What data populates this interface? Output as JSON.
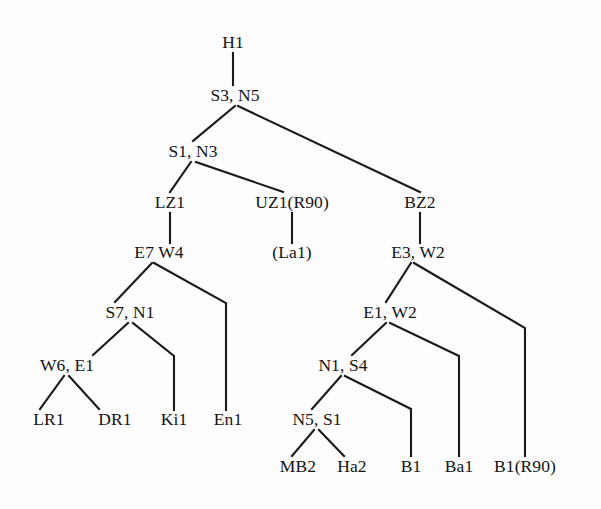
{
  "diagram": {
    "type": "tree",
    "stroke_color": "#1a1a1a",
    "text_color": "#141414",
    "background_color": "#fdfdfd",
    "nodes": [
      {
        "id": "h1",
        "label": "H1",
        "x": 233,
        "y": 43
      },
      {
        "id": "s3n5",
        "label": "S3, N5",
        "x": 235,
        "y": 96
      },
      {
        "id": "s1n3",
        "label": "S1, N3",
        "x": 193,
        "y": 152
      },
      {
        "id": "lz1",
        "label": "LZ1",
        "x": 170,
        "y": 203
      },
      {
        "id": "uz1r90",
        "label": "UZ1(R90)",
        "x": 292,
        "y": 203
      },
      {
        "id": "bz2",
        "label": "BZ2",
        "x": 420,
        "y": 203
      },
      {
        "id": "e7w4",
        "label": "E7 W4",
        "x": 159,
        "y": 253
      },
      {
        "id": "la1",
        "label": "(La1)",
        "x": 292,
        "y": 253
      },
      {
        "id": "e3w2",
        "label": "E3, W2",
        "x": 418,
        "y": 253
      },
      {
        "id": "s7n1",
        "label": "S7, N1",
        "x": 130,
        "y": 313
      },
      {
        "id": "e1w2",
        "label": "E1, W2",
        "x": 390,
        "y": 313
      },
      {
        "id": "w6e1",
        "label": "W6, E1",
        "x": 67,
        "y": 366
      },
      {
        "id": "n1s4",
        "label": "N1, S4",
        "x": 343,
        "y": 366
      },
      {
        "id": "lr1",
        "label": "LR1",
        "x": 49,
        "y": 420
      },
      {
        "id": "dr1",
        "label": "DR1",
        "x": 115,
        "y": 420
      },
      {
        "id": "ki1",
        "label": "Ki1",
        "x": 174,
        "y": 420
      },
      {
        "id": "en1",
        "label": "En1",
        "x": 228,
        "y": 420
      },
      {
        "id": "n5s1",
        "label": "N5, S1",
        "x": 317,
        "y": 420
      },
      {
        "id": "mb2",
        "label": "MB2",
        "x": 298,
        "y": 467
      },
      {
        "id": "ha2",
        "label": "Ha2",
        "x": 352,
        "y": 467
      },
      {
        "id": "b1",
        "label": "B1",
        "x": 411,
        "y": 467
      },
      {
        "id": "ba1",
        "label": "Ba1",
        "x": 459,
        "y": 467
      },
      {
        "id": "b1r90",
        "label": "B1(R90)",
        "x": 525,
        "y": 467
      }
    ],
    "edges": [
      {
        "from": "h1",
        "to": "s3n5",
        "points": "233,53 233,85"
      },
      {
        "from": "s3n5",
        "to": "s1n3",
        "points": "235,106 193,141"
      },
      {
        "from": "s3n5",
        "to": "bz2",
        "points": "238,106 420,192"
      },
      {
        "from": "s1n3",
        "to": "lz1",
        "points": "191,162 170,192"
      },
      {
        "from": "s1n3",
        "to": "uz1r90",
        "points": "196,162 283,192"
      },
      {
        "from": "lz1",
        "to": "e7w4",
        "points": "170,213 170,243"
      },
      {
        "from": "uz1r90",
        "to": "la1",
        "points": "292,213 292,243"
      },
      {
        "from": "bz2",
        "to": "e3w2",
        "points": "420,213 420,243"
      },
      {
        "from": "e7w4",
        "to": "s7n1",
        "points": "152,263 115,302"
      },
      {
        "from": "e7w4",
        "to": "en1",
        "points": "154,263 226,303 226,410"
      },
      {
        "from": "s7n1",
        "to": "w6e1",
        "points": "128,323 93,355"
      },
      {
        "from": "s7n1",
        "to": "ki1",
        "points": "133,323 174,356 174,410"
      },
      {
        "from": "w6e1",
        "to": "lr1",
        "points": "64,376 40,409"
      },
      {
        "from": "w6e1",
        "to": "dr1",
        "points": "69,376 99,409"
      },
      {
        "from": "e3w2",
        "to": "e1w2",
        "points": "411,263 386,302"
      },
      {
        "from": "e3w2",
        "to": "b1r90",
        "points": "414,263 525,328 525,456"
      },
      {
        "from": "e1w2",
        "to": "n1s4",
        "points": "386,323 352,355"
      },
      {
        "from": "e1w2",
        "to": "ba1",
        "points": "390,323 459,356 459,456"
      },
      {
        "from": "n1s4",
        "to": "n5s1",
        "points": "341,376 312,409"
      },
      {
        "from": "n1s4",
        "to": "b1",
        "points": "345,376 411,409 411,456"
      },
      {
        "from": "n5s1",
        "to": "mb2",
        "points": "314,430 292,456"
      },
      {
        "from": "n5s1",
        "to": "ha2",
        "points": "319,430 344,456"
      }
    ]
  }
}
